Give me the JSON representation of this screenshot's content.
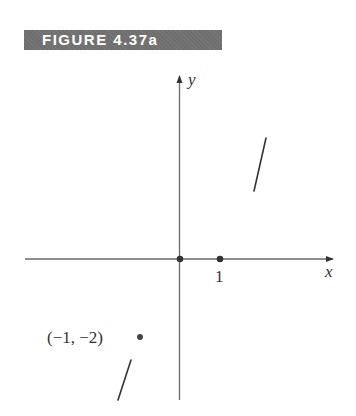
{
  "figure": {
    "label": "FIGURE 4.37a",
    "axes": {
      "x_label": "x",
      "y_label": "y",
      "tick_x_1": "1"
    },
    "points": [
      {
        "name": "origin",
        "x": 0,
        "y": 0,
        "label": ""
      },
      {
        "name": "x-one",
        "x": 1,
        "y": 0,
        "label": ""
      },
      {
        "name": "neg-one-neg-two",
        "x": -1,
        "y": -2,
        "label": "(−1, −2)"
      }
    ],
    "segments": [
      {
        "name": "upper-right-segment",
        "description": "short steep line segment in first quadrant"
      },
      {
        "name": "lower-left-segment",
        "description": "short steep line segment in third quadrant"
      }
    ],
    "colors": {
      "banner_bg": "#6f6f6f",
      "banner_text": "#ffffff",
      "axis": "#6a6a6a",
      "ink": "#333333"
    }
  }
}
